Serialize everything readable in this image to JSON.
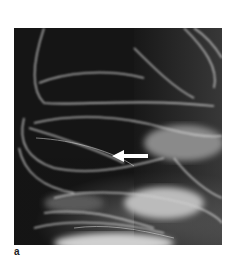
{
  "figure": {
    "panel_label": "a",
    "image_description": "grayscale radiograph with contrast-filled folds",
    "annotation": {
      "type": "arrow",
      "direction": "left",
      "color": "#ffffff"
    },
    "colors": {
      "background": "#141414",
      "highlight": "#e8e8e8"
    }
  }
}
